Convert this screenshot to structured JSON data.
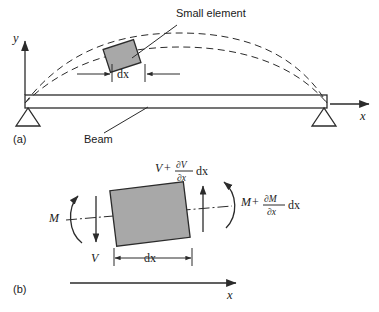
{
  "figure": {
    "type": "engineering-diagram",
    "panels": [
      {
        "id": "a",
        "label": "(a)",
        "axis_y_label": "y",
        "axis_x_label": "x",
        "callouts": [
          {
            "name": "small-element",
            "text": "Small element"
          },
          {
            "name": "beam",
            "text": "Beam"
          }
        ],
        "dimension_label": "dx",
        "deflection_curves": 2,
        "supports": 2
      },
      {
        "id": "b",
        "label": "(b)",
        "axis_x_label": "x",
        "dimension_label": "dx",
        "forces": {
          "shear_left": "V",
          "moment_left": "M",
          "shear_right_base": "V",
          "shear_right_operator": "+",
          "shear_right_numer": "∂V",
          "shear_right_denom": "∂x",
          "shear_right_diff": "dx",
          "moment_right_base": "M",
          "moment_right_operator": "+",
          "moment_right_numer": "∂M",
          "moment_right_denom": "∂x",
          "moment_right_diff": "dx"
        }
      }
    ],
    "colors": {
      "line": "#2b2b2b",
      "element_fill": "#a8a8a8",
      "background": "#ffffff"
    }
  }
}
